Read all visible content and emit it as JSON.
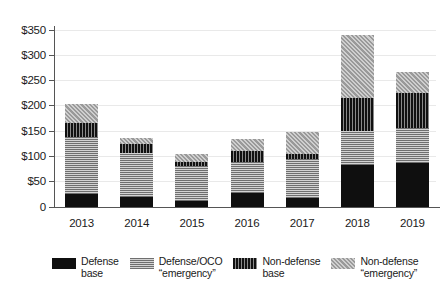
{
  "chart_data": {
    "type": "bar",
    "subtype": "stacked-bar",
    "title": "",
    "subtitle": "",
    "xlabel": "",
    "ylabel": "",
    "categories": [
      "2013",
      "2014",
      "2015",
      "2016",
      "2017",
      "2018",
      "2019"
    ],
    "ylim": [
      0,
      360
    ],
    "yticks": [
      0,
      50,
      100,
      150,
      200,
      250,
      300,
      350
    ],
    "ytick_labels": [
      "0",
      "$50",
      "$100",
      "$150",
      "$200",
      "$250",
      "$300",
      "$350"
    ],
    "grid": true,
    "legend_position": "bottom",
    "series": [
      {
        "name": "Defense base",
        "pattern": "solid-black",
        "color": "#0f0f0f",
        "values": [
          26,
          20,
          11,
          28,
          17,
          83,
          88
        ]
      },
      {
        "name": "Defense/OCO “emergency”",
        "pattern": "horizontal-stripes",
        "color": "#8c8c8c",
        "values": [
          114,
          88,
          70,
          62,
          78,
          69,
          69
        ]
      },
      {
        "name": "Non-defense base",
        "pattern": "vertical-stripes",
        "color": "#2a2a2a",
        "values": [
          28,
          18,
          8,
          21,
          10,
          65,
          70
        ]
      },
      {
        "name": "Non-defense “emergency”",
        "pattern": "diagonal-hatch",
        "color": "#a8a8a8",
        "values": [
          37,
          12,
          16,
          24,
          45,
          126,
          42
        ]
      }
    ],
    "totals": [
      205,
      138,
      105,
      135,
      150,
      343,
      269
    ],
    "units": "billions of dollars"
  },
  "legend": {
    "items": [
      {
        "label": "Defense\nbase",
        "swatch": "defense-base-swatch"
      },
      {
        "label": "Defense/OCO\n“emergency”",
        "swatch": "defense-oco-swatch"
      },
      {
        "label": "Non-defense\nbase",
        "swatch": "nondefense-base-swatch"
      },
      {
        "label": "Non-defense\n“emergency”",
        "swatch": "nondefense-emergency-swatch"
      }
    ]
  },
  "axes": {
    "y": {
      "labels": [
        "$350",
        "$300",
        "$250",
        "$200",
        "$150",
        "$100",
        "$50",
        "0"
      ]
    },
    "x": {
      "labels": [
        "2013",
        "2014",
        "2015",
        "2016",
        "2017",
        "2018",
        "2019"
      ]
    }
  }
}
